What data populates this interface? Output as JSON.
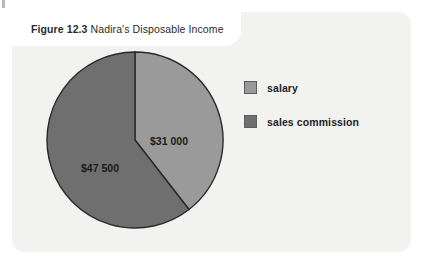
{
  "figure": {
    "number_label": "Figure 12.3",
    "title": "Nadira's Disposable Income"
  },
  "colors": {
    "page_background": "#ffffff",
    "card_background": "#f2f2f1",
    "banner_background": "#ffffff",
    "salary_slice": "#9a9a9a",
    "sales_commission_slice": "#6f6f6f",
    "slice_outline": "#2a2a2a",
    "label_text": "#1b1b1b"
  },
  "legend": {
    "items": [
      {
        "label": "salary",
        "color": "#9a9a9a",
        "swatch_name": "legend-swatch-salary"
      },
      {
        "label": "sales commission",
        "color": "#6f6f6f",
        "swatch_name": "legend-swatch-sales-commission"
      }
    ]
  },
  "chart_data": {
    "type": "pie",
    "title": "Nadira's Disposable Income",
    "categories": [
      "salary",
      "sales commission"
    ],
    "values": [
      31000,
      47500
    ],
    "value_labels": [
      "$31 000",
      "$47 500"
    ],
    "colors": [
      "#9a9a9a",
      "#6f6f6f"
    ],
    "total": 78500,
    "percentages": [
      39.5,
      60.5
    ],
    "start_angle_deg": 0,
    "direction": "clockwise",
    "legend_position": "right",
    "grid": false,
    "xlabel": "",
    "ylabel": ""
  },
  "geometry": {
    "center_x": 92,
    "center_y": 92,
    "radius": 88,
    "label_positions": [
      {
        "text_key": "0",
        "x": 126,
        "y": 97
      },
      {
        "text_key": "1",
        "x": 57,
        "y": 124
      }
    ]
  }
}
